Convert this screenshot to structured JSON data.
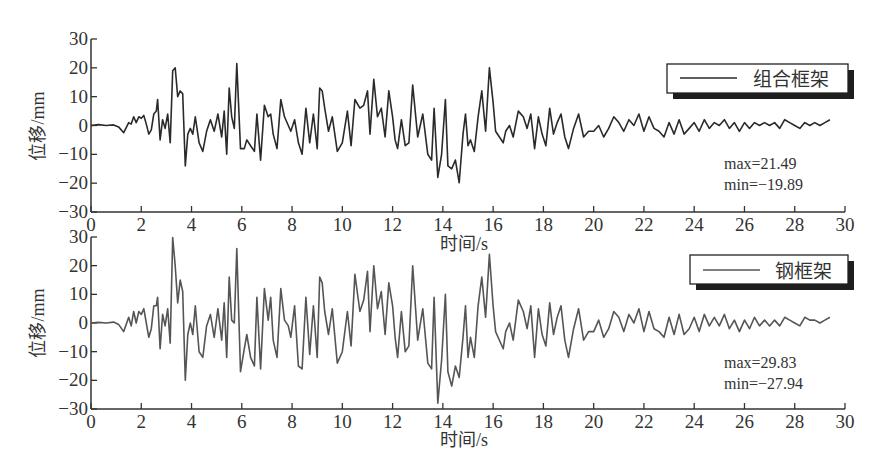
{
  "chart_data": [
    {
      "type": "line",
      "title": "",
      "xlabel": "时间/s",
      "ylabel": "位移/mm",
      "xlim": [
        0,
        30
      ],
      "ylim": [
        -30,
        30
      ],
      "xticks": [
        0,
        2,
        4,
        6,
        8,
        10,
        12,
        14,
        16,
        18,
        20,
        22,
        24,
        26,
        28,
        30
      ],
      "yticks": [
        30,
        20,
        10,
        0,
        -10,
        -20,
        -30
      ],
      "grid": false,
      "legend": {
        "position": "upper right",
        "entries": [
          "组合框架"
        ]
      },
      "line_color": "#2a2a2a",
      "annotations": [
        "max=21.49",
        "min=−19.89"
      ],
      "series": [
        {
          "name": "组合框架",
          "max": 21.49,
          "min": -19.89,
          "x": [
            0,
            0.3,
            0.6,
            0.9,
            1.1,
            1.3,
            1.5,
            1.6,
            1.7,
            1.8,
            1.9,
            2.0,
            2.1,
            2.2,
            2.3,
            2.4,
            2.5,
            2.6,
            2.65,
            2.75,
            2.85,
            2.95,
            3.05,
            3.15,
            3.25,
            3.35,
            3.45,
            3.55,
            3.65,
            3.75,
            3.85,
            3.95,
            4.05,
            4.15,
            4.3,
            4.45,
            4.6,
            4.75,
            4.9,
            5.05,
            5.2,
            5.3,
            5.4,
            5.5,
            5.6,
            5.7,
            5.8,
            5.95,
            6.1,
            6.2,
            6.35,
            6.5,
            6.6,
            6.75,
            6.9,
            7.05,
            7.15,
            7.25,
            7.4,
            7.55,
            7.7,
            7.85,
            7.95,
            8.1,
            8.25,
            8.4,
            8.55,
            8.7,
            8.85,
            9.0,
            9.1,
            9.2,
            9.3,
            9.45,
            9.6,
            9.8,
            10.0,
            10.2,
            10.35,
            10.5,
            10.7,
            10.85,
            11.0,
            11.1,
            11.25,
            11.4,
            11.55,
            11.7,
            11.85,
            12.0,
            12.1,
            12.2,
            12.35,
            12.5,
            12.65,
            12.8,
            13.0,
            13.2,
            13.4,
            13.55,
            13.65,
            13.8,
            13.95,
            14.1,
            14.2,
            14.35,
            14.5,
            14.65,
            14.8,
            14.9,
            15.0,
            15.1,
            15.25,
            15.4,
            15.55,
            15.7,
            15.85,
            16.0,
            16.1,
            16.25,
            16.4,
            16.5,
            16.65,
            16.8,
            17.0,
            17.2,
            17.35,
            17.5,
            17.65,
            17.8,
            17.95,
            18.1,
            18.25,
            18.4,
            18.55,
            18.7,
            18.85,
            19.0,
            19.2,
            19.4,
            19.6,
            19.8,
            20.0,
            20.2,
            20.4,
            20.6,
            20.8,
            21.0,
            21.2,
            21.4,
            21.6,
            21.8,
            22.0,
            22.2,
            22.4,
            22.6,
            22.8,
            23.0,
            23.2,
            23.4,
            23.6,
            23.8,
            24.0,
            24.2,
            24.4,
            24.6,
            24.8,
            25.0,
            25.2,
            25.4,
            25.6,
            25.8,
            26.0,
            26.2,
            26.4,
            26.6,
            26.8,
            27.0,
            27.2,
            27.4,
            27.6,
            27.8,
            28.0,
            28.2,
            28.4,
            28.6,
            28.8,
            29.0,
            29.2,
            29.4,
            29.6,
            29.8,
            30.0
          ],
          "y": [
            0,
            0.3,
            0,
            0.2,
            -0.5,
            -2.5,
            1,
            0.5,
            3,
            1,
            3,
            2.5,
            3.5,
            0.5,
            -3,
            -1.5,
            4,
            5,
            9,
            -5,
            2,
            -1,
            4,
            -6,
            19,
            20,
            10,
            12,
            11,
            -14,
            -3,
            -1,
            -3,
            3,
            -6,
            -9,
            -2,
            2,
            -2,
            4,
            -4,
            5,
            -10,
            13,
            3,
            -1,
            21.49,
            -8,
            -8,
            -5,
            -7,
            -9,
            4,
            -12,
            7,
            3,
            4,
            -3,
            -8,
            9,
            3,
            0,
            -2,
            2,
            -6,
            -10,
            6,
            -6,
            4,
            -8,
            13,
            12,
            6,
            -2,
            3,
            -9,
            -6,
            5,
            -7,
            9,
            6,
            7,
            12,
            -3,
            16,
            3,
            6,
            -4,
            12,
            3,
            -5,
            -8,
            2,
            -7,
            -6,
            14,
            -4,
            4,
            -10,
            -12,
            6,
            -18,
            -10,
            9,
            -14,
            -15,
            -12,
            -19.89,
            -3,
            4,
            -7,
            -5,
            -9,
            3,
            12,
            -2,
            20,
            8,
            -2,
            -4,
            -6,
            -2,
            0,
            -4,
            5,
            3,
            -1,
            4,
            -8,
            3,
            -3,
            -7,
            6,
            -3,
            1,
            4,
            -4,
            -8,
            -1,
            4,
            -4,
            -2,
            -2,
            0,
            -4,
            -1,
            3,
            1,
            -2,
            2,
            0,
            4,
            -2,
            3,
            -1,
            -2,
            -4,
            1,
            -3,
            2,
            -3,
            -1,
            1,
            -2,
            2,
            -1,
            1,
            0,
            2,
            -1,
            1,
            -2,
            1,
            -1,
            1,
            0,
            1,
            0,
            1,
            -1,
            2,
            1,
            0,
            -1,
            1,
            0,
            1,
            0,
            1,
            2
          ]
        }
      ]
    },
    {
      "type": "line",
      "title": "",
      "xlabel": "时间/s",
      "ylabel": "位移/mm",
      "xlim": [
        0,
        30
      ],
      "ylim": [
        -30,
        30
      ],
      "xticks": [
        0,
        2,
        4,
        6,
        8,
        10,
        12,
        14,
        16,
        18,
        20,
        22,
        24,
        26,
        28,
        30
      ],
      "yticks": [
        30,
        20,
        10,
        0,
        -10,
        -20,
        -30
      ],
      "grid": false,
      "legend": {
        "position": "upper right",
        "entries": [
          "钢框架"
        ]
      },
      "line_color": "#555555",
      "annotations": [
        "max=29.83",
        "min=−27.94"
      ],
      "series": [
        {
          "name": "钢框架",
          "max": 29.83,
          "min": -27.94,
          "x": [
            0,
            0.3,
            0.6,
            0.9,
            1.1,
            1.3,
            1.5,
            1.6,
            1.7,
            1.8,
            1.9,
            2.0,
            2.1,
            2.2,
            2.3,
            2.4,
            2.5,
            2.6,
            2.65,
            2.75,
            2.85,
            2.95,
            3.05,
            3.15,
            3.25,
            3.35,
            3.45,
            3.55,
            3.65,
            3.75,
            3.85,
            3.95,
            4.05,
            4.15,
            4.3,
            4.45,
            4.6,
            4.75,
            4.9,
            5.05,
            5.2,
            5.3,
            5.4,
            5.5,
            5.6,
            5.7,
            5.8,
            5.95,
            6.1,
            6.2,
            6.35,
            6.5,
            6.6,
            6.75,
            6.9,
            7.05,
            7.15,
            7.25,
            7.4,
            7.55,
            7.7,
            7.85,
            7.95,
            8.1,
            8.25,
            8.4,
            8.55,
            8.7,
            8.85,
            9.0,
            9.1,
            9.2,
            9.3,
            9.45,
            9.6,
            9.8,
            10.0,
            10.2,
            10.35,
            10.5,
            10.7,
            10.85,
            11.0,
            11.1,
            11.25,
            11.4,
            11.55,
            11.7,
            11.85,
            12.0,
            12.1,
            12.2,
            12.35,
            12.5,
            12.65,
            12.8,
            13.0,
            13.2,
            13.4,
            13.55,
            13.65,
            13.8,
            13.95,
            14.1,
            14.2,
            14.35,
            14.5,
            14.65,
            14.8,
            14.9,
            15.0,
            15.1,
            15.25,
            15.4,
            15.55,
            15.7,
            15.85,
            16.0,
            16.1,
            16.25,
            16.4,
            16.5,
            16.65,
            16.8,
            17.0,
            17.2,
            17.35,
            17.5,
            17.65,
            17.8,
            17.95,
            18.1,
            18.25,
            18.4,
            18.55,
            18.7,
            18.85,
            19.0,
            19.2,
            19.4,
            19.6,
            19.8,
            20.0,
            20.2,
            20.4,
            20.6,
            20.8,
            21.0,
            21.2,
            21.4,
            21.6,
            21.8,
            22.0,
            22.2,
            22.4,
            22.6,
            22.8,
            23.0,
            23.2,
            23.4,
            23.6,
            23.8,
            24.0,
            24.2,
            24.4,
            24.6,
            24.8,
            25.0,
            25.2,
            25.4,
            25.6,
            25.8,
            26.0,
            26.2,
            26.4,
            26.6,
            26.8,
            27.0,
            27.2,
            27.4,
            27.6,
            27.8,
            28.0,
            28.2,
            28.4,
            28.6,
            28.8,
            29.0,
            29.2,
            29.4,
            29.6,
            29.8,
            30.0
          ],
          "y": [
            0,
            0.2,
            0,
            0.3,
            -0.5,
            -3,
            2,
            -1,
            4,
            0,
            4,
            3,
            5,
            0,
            -5,
            -2,
            6,
            6,
            9,
            -9,
            3,
            -1,
            5,
            -7,
            29.83,
            20,
            7,
            15,
            11,
            -20,
            -4,
            0,
            -4,
            6,
            -10,
            -12,
            -1,
            3,
            -5,
            5,
            -6,
            7,
            -12,
            16,
            1,
            0,
            26,
            -17,
            -9,
            -4,
            -12,
            -15,
            9,
            -16,
            12,
            1,
            9,
            -6,
            -12,
            12,
            1,
            -1,
            -5,
            6,
            -15,
            -16,
            9,
            -11,
            6,
            -12,
            16,
            14,
            4,
            -4,
            5,
            -14,
            -10,
            4,
            -8,
            17,
            4,
            8,
            18,
            -3,
            20,
            5,
            11,
            -4,
            14,
            6,
            -5,
            -12,
            4,
            -10,
            -8,
            20,
            -6,
            5,
            -14,
            -16,
            9,
            -27.94,
            -13,
            10,
            -17,
            -22,
            -15,
            -19,
            -5,
            6,
            -12,
            -5,
            -12,
            6,
            16,
            2,
            24,
            6,
            -3,
            -6,
            -9,
            -3,
            0,
            -6,
            8,
            4,
            -2,
            6,
            -12,
            5,
            -4,
            -8,
            7,
            -4,
            2,
            6,
            -6,
            -12,
            -2,
            5,
            -6,
            -3,
            -3,
            1,
            -5,
            -2,
            4,
            2,
            -3,
            3,
            0,
            5,
            -3,
            4,
            -2,
            -3,
            -5,
            2,
            -4,
            3,
            -4,
            -2,
            2,
            -3,
            3,
            -1,
            2,
            -1,
            3,
            -2,
            1,
            -3,
            1,
            -2,
            2,
            -1,
            1,
            -1,
            1,
            -1,
            2,
            1,
            0,
            -1,
            2,
            1,
            1,
            0,
            1,
            2
          ]
        }
      ]
    }
  ],
  "plots": [
    {
      "legend_label": "组合框架",
      "max_text": "max=21.49",
      "min_text": "min=−19.89",
      "xlabel": "时间/s",
      "ylabel": "位移/mm"
    },
    {
      "legend_label": "钢框架",
      "max_text": "max=29.83",
      "min_text": "min=−27.94",
      "xlabel": "时间/s",
      "ylabel": "位移/mm"
    }
  ],
  "tick_labels": {
    "x": [
      "0",
      "2",
      "4",
      "6",
      "8",
      "10",
      "12",
      "14",
      "16",
      "18",
      "20",
      "22",
      "24",
      "26",
      "28",
      "30"
    ],
    "y": [
      "30",
      "20",
      "10",
      "0",
      "−10",
      "−20",
      "−30"
    ]
  }
}
